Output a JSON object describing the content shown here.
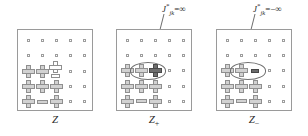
{
  "figure": {
    "type": "diagram",
    "background_color": "#ffffff",
    "glyph_legend": {
      "dot": "empty lattice site (small open square)",
      "cross": "grey plus/cross symbol (spin up)",
      "cross-hollow": "white/unfilled plus symbol",
      "cross-dark": "dark filled plus symbol (clamped spin)",
      "bar": "grey horizontal bar (spin down)",
      "bar-dark": "dark filled horizontal bar (clamped spin)",
      "cross-over-bar": "white plus stacked above a white bar"
    },
    "colors": {
      "panel_border": "#9a9a9a",
      "glyph_fill": "#d2d2d2",
      "glyph_stroke": "#8f8f8f",
      "glyph_dark_fill": "#6e6e6e",
      "ellipse_stroke": "#6f6f6f",
      "text": "#2b2b2b"
    }
  },
  "annotations": [
    {
      "id": "annot-0",
      "symbol": "J",
      "superscript": "*",
      "subscript": "jk",
      "relation": "=",
      "value": "∞",
      "text": "J*jk = ∞",
      "leader_from": [
        163,
        13
      ],
      "leader_to": [
        150,
        68
      ]
    },
    {
      "id": "annot-1",
      "symbol": "J",
      "superscript": "*",
      "subscript": "jk",
      "relation": "=",
      "value": "−∞",
      "text": "J*jk = −∞",
      "leader_from": [
        254,
        13
      ],
      "leader_to": [
        242,
        68
      ]
    }
  ],
  "panels": [
    {
      "id": "panel-0",
      "label": "Z",
      "label_subscript": "",
      "rows": 5,
      "cols": 5,
      "highlight": null,
      "cells": [
        [
          "dot",
          "dot",
          "dot",
          "dot",
          "dot"
        ],
        [
          "dot",
          "dot",
          "dot",
          "dot",
          "dot"
        ],
        [
          "cross",
          "cross",
          "cross-over-bar",
          "dot",
          "dot"
        ],
        [
          "cross",
          "cross",
          "cross",
          "dot",
          "dot"
        ],
        [
          "cross",
          "bar",
          "cross",
          "dot",
          "dot"
        ]
      ]
    },
    {
      "id": "panel-1",
      "label": "Z",
      "label_subscript": "+",
      "rows": 5,
      "cols": 5,
      "highlight": {
        "row": 2,
        "col_start": 1,
        "col_end": 2,
        "shape": "ellipse"
      },
      "cells": [
        [
          "dot",
          "dot",
          "dot",
          "dot",
          "dot"
        ],
        [
          "dot",
          "dot",
          "dot",
          "dot",
          "dot"
        ],
        [
          "cross",
          "cross",
          "cross-dark",
          "dot",
          "dot"
        ],
        [
          "cross",
          "cross",
          "cross",
          "dot",
          "dot"
        ],
        [
          "cross",
          "bar",
          "cross",
          "dot",
          "dot"
        ]
      ]
    },
    {
      "id": "panel-2",
      "label": "Z",
      "label_subscript": "−",
      "rows": 5,
      "cols": 5,
      "highlight": {
        "row": 2,
        "col_start": 1,
        "col_end": 2,
        "shape": "ellipse"
      },
      "cells": [
        [
          "dot",
          "dot",
          "dot",
          "dot",
          "dot"
        ],
        [
          "dot",
          "dot",
          "dot",
          "dot",
          "dot"
        ],
        [
          "cross",
          "cross",
          "bar-dark",
          "dot",
          "dot"
        ],
        [
          "cross",
          "cross",
          "cross",
          "dot",
          "dot"
        ],
        [
          "cross",
          "bar",
          "cross",
          "dot",
          "dot"
        ]
      ]
    }
  ]
}
